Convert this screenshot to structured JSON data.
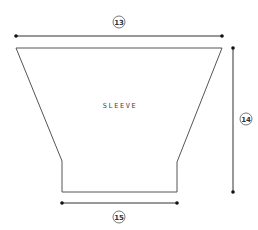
{
  "diagram": {
    "piece_label": "SLEEVE",
    "colors": {
      "outline": "#555555",
      "dimension_line": "#333333",
      "dot": "#111111",
      "background": "#ffffff"
    },
    "shape": {
      "points": [
        [
          16,
          48
        ],
        [
          222,
          48
        ],
        [
          177,
          162
        ],
        [
          177,
          192
        ],
        [
          62,
          192
        ],
        [
          62,
          161
        ]
      ]
    },
    "dimensions": [
      {
        "id": "13",
        "label": "13",
        "orientation": "horizontal",
        "from": [
          16,
          36
        ],
        "to": [
          222,
          36
        ],
        "badge": [
          119,
          22
        ]
      },
      {
        "id": "14",
        "label": "14",
        "orientation": "vertical",
        "from": [
          233,
          48
        ],
        "to": [
          233,
          192
        ],
        "badge": [
          246,
          119
        ]
      },
      {
        "id": "15",
        "label": "15",
        "orientation": "horizontal",
        "from": [
          62,
          203
        ],
        "to": [
          177,
          203
        ],
        "badge": [
          119,
          217
        ]
      }
    ]
  }
}
